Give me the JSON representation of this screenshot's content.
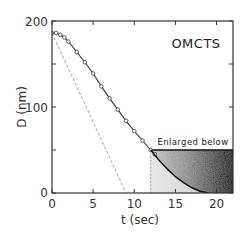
{
  "chart_data": {
    "type": "line",
    "title": "",
    "xlabel": "t  (sec)",
    "ylabel": "D  (nm)",
    "xlim": [
      0,
      22
    ],
    "ylim": [
      0,
      200
    ],
    "xticks": [
      0,
      5,
      10,
      15,
      20
    ],
    "yticks": [
      0,
      100,
      200
    ],
    "yminor_ticks": [
      50,
      150
    ],
    "grid": false,
    "annotations": [
      {
        "text": "OMCTS",
        "x": 18,
        "y": 172
      },
      {
        "text": "Enlarged below",
        "x": 17,
        "y": 58
      }
    ],
    "series": [
      {
        "name": "measured D(t)",
        "style": "solid line with circle markers",
        "x": [
          0,
          0.5,
          1,
          1.5,
          2,
          3,
          4,
          5,
          6,
          7,
          8,
          9,
          10,
          11,
          12,
          12.5
        ],
        "y": [
          186,
          186,
          184,
          181,
          176,
          164,
          152,
          139,
          124,
          110,
          97,
          84,
          72,
          61,
          50,
          45
        ]
      },
      {
        "name": "fitted curve continuation",
        "style": "solid line",
        "x": [
          12,
          13,
          14,
          15,
          16,
          17,
          18,
          19
        ],
        "y": [
          50,
          38,
          28,
          19,
          12,
          6,
          2,
          0
        ]
      },
      {
        "name": "initial slope extrapolation",
        "style": "dashed line",
        "x": [
          0,
          9
        ],
        "y": [
          186,
          0
        ]
      },
      {
        "name": "vertical marker",
        "style": "dotted line",
        "x": [
          12,
          12
        ],
        "y": [
          0,
          45
        ]
      }
    ],
    "shaded_region": {
      "x": [
        12,
        22
      ],
      "y": [
        0,
        50
      ],
      "label": "Enlarged below"
    }
  }
}
